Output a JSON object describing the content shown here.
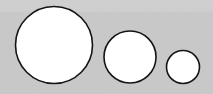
{
  "figure": {
    "canvas": {
      "width": 213,
      "height": 94
    },
    "background": {
      "base_color": "#c9c9c9",
      "upper_band_color": "#d2d2d2",
      "band_split_y": 12,
      "noise": "subtle-grain"
    },
    "style": {
      "fill_color": "#ffffff",
      "stroke_color": "#141414",
      "stroke_width": 1.6
    },
    "shapes": [
      {
        "name": "large-circle",
        "label": "Circle 1",
        "cx": 54,
        "cy": 45,
        "r": 38.5,
        "diameter": 77,
        "fill": "#ffffff",
        "stroke": "#141414"
      },
      {
        "name": "medium-circle",
        "label": "Circle 2",
        "cx": 130,
        "cy": 57,
        "r": 26,
        "diameter": 52,
        "fill": "#ffffff",
        "stroke": "#141414"
      },
      {
        "name": "small-circle",
        "label": "Circle 3",
        "cx": 183,
        "cy": 67,
        "r": 16.5,
        "diameter": 33,
        "fill": "#ffffff",
        "stroke": "#141414"
      }
    ]
  },
  "chart_data": {
    "type": "scatter",
    "xlabel": "",
    "ylabel": "",
    "xlim": [
      0,
      213
    ],
    "ylim": [
      94,
      0
    ],
    "grid": false,
    "legend": "none",
    "categories": [
      "Circle 1",
      "Circle 2",
      "Circle 3"
    ],
    "series": [
      {
        "name": "center_x",
        "values": [
          54,
          130,
          183
        ]
      },
      {
        "name": "center_y",
        "values": [
          45,
          57,
          67
        ]
      },
      {
        "name": "diameter",
        "values": [
          77,
          52,
          33
        ]
      },
      {
        "name": "radius",
        "values": [
          38.5,
          26,
          16.5
        ]
      }
    ],
    "annotations": []
  }
}
